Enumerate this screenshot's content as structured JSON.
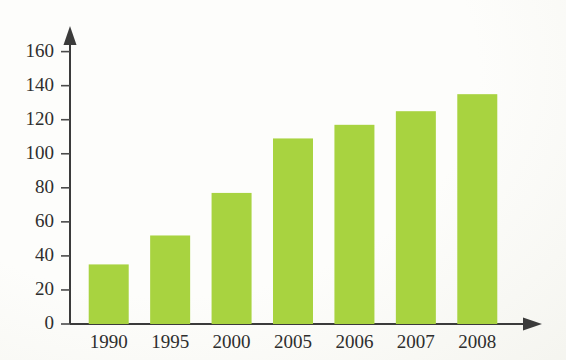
{
  "chart_data": {
    "type": "bar",
    "title": "",
    "subtitle": "",
    "xlabel": "",
    "ylabel": "",
    "categories": [
      "1990",
      "1995",
      "2000",
      "2005",
      "2006",
      "2007",
      "2008"
    ],
    "values": [
      35,
      52,
      77,
      109,
      117,
      125,
      135
    ],
    "ylim": [
      0,
      168
    ],
    "yticks": [
      0,
      20,
      40,
      60,
      80,
      100,
      120,
      140,
      160
    ],
    "ytick_labels": [
      "0",
      "20",
      "40",
      "60",
      "80",
      "100",
      "120",
      "140",
      "160"
    ],
    "grid": false,
    "legend": false,
    "legend_position": "none",
    "bar_color": "#a8d340",
    "axis_color": "#3b3b3b",
    "axis_style": "arrow-tipped-l-axes",
    "background_color": "#fdfdfb"
  },
  "axis": {
    "y_arrow": "arrow-up-icon",
    "x_arrow": "arrow-right-icon"
  }
}
